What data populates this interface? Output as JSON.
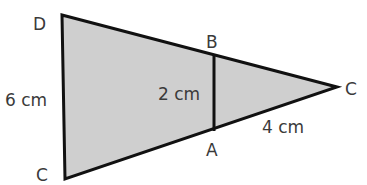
{
  "diagram": {
    "type": "similar-triangles",
    "fill_color": "#cfcfcf",
    "stroke_color": "#111111",
    "vertices": {
      "D": {
        "label": "D"
      },
      "C_bottom": {
        "label": "C"
      },
      "B": {
        "label": "B"
      },
      "A": {
        "label": "A"
      },
      "C_apex": {
        "label": "C"
      }
    },
    "measurements": {
      "DC": "6 cm",
      "AB": "2 cm",
      "AC": "4 cm"
    }
  }
}
